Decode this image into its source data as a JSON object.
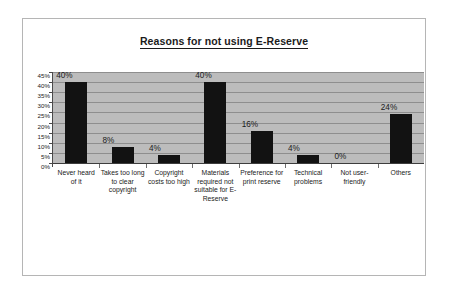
{
  "chart_data": {
    "type": "bar",
    "title": "Reasons for not using E-Reserve",
    "xlabel": "",
    "ylabel": "",
    "categories": [
      "Never heard of it",
      "Takes too long to clear copyright",
      "Copyright costs too high",
      "Materials required not suitable for E-Reserve",
      "Preference for print reserve",
      "Technical problems",
      "Not user-friendly",
      "Others"
    ],
    "values": [
      40,
      8,
      4,
      40,
      16,
      4,
      0,
      24
    ],
    "value_labels": [
      "40%",
      "8%",
      "4%",
      "40%",
      "16%",
      "4%",
      "0%",
      "24%"
    ],
    "ylim": [
      0,
      45
    ],
    "ytick_values": [
      45,
      40,
      35,
      30,
      25,
      20,
      15,
      10,
      5,
      0
    ],
    "ytick_labels": [
      "45%",
      "40%",
      "35%",
      "30%",
      "25%",
      "20%",
      "15%",
      "10%",
      "5%",
      "0%"
    ],
    "grid": true,
    "legend": false,
    "legend_position": "none",
    "bar_color": "#121212",
    "plot_background": "#bcbcbc",
    "gridline_color": "#8e8e8e",
    "axis_color": "#3d3d3d"
  }
}
